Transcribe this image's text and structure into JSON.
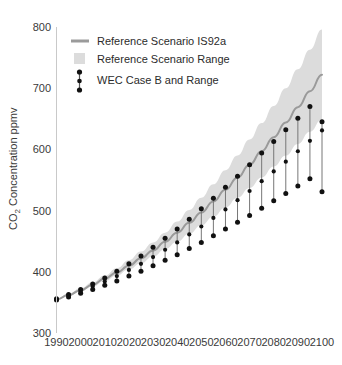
{
  "chart_data": {
    "type": "line",
    "title": "",
    "xlabel": "",
    "ylabel": "CO₂ Concentration ppmv",
    "ylabel_main": "Concentration ppmv",
    "ylabel_sub": "2",
    "ylabel_prefix": "CO",
    "xlim": [
      1990,
      2100
    ],
    "ylim": [
      300,
      800
    ],
    "ytick_values": [
      300,
      400,
      500,
      600,
      700,
      800
    ],
    "ytick_labels": [
      "300",
      "400",
      "500",
      "600",
      "700",
      "800"
    ],
    "xtick_values": [
      1990,
      2000,
      2010,
      2020,
      2030,
      2040,
      2050,
      2060,
      2070,
      2080,
      2090,
      2100
    ],
    "xtick_labels": [
      "1990",
      "2000",
      "2010",
      "2020",
      "2030",
      "2040",
      "2050",
      "2060",
      "2070",
      "2080",
      "2090",
      "2100"
    ],
    "grid": false,
    "legend_position": "top-left",
    "legend": [
      {
        "label": "Reference Scenario IS92a",
        "marker": "line",
        "color": "#9a9a9a"
      },
      {
        "label": "Reference Scenario Range",
        "marker": "band",
        "color": "#dcdcdc"
      },
      {
        "label": "WEC Case B and Range",
        "marker": "errorbar",
        "color": "#1a1a1a"
      }
    ],
    "series": [
      {
        "name": "Reference Scenario IS92a",
        "type": "line",
        "color": "#9a9a9a",
        "x": [
          1990,
          1995,
          2000,
          2005,
          2010,
          2015,
          2020,
          2025,
          2030,
          2035,
          2040,
          2045,
          2050,
          2055,
          2060,
          2065,
          2070,
          2075,
          2080,
          2085,
          2090,
          2095,
          2100
        ],
        "values": [
          355,
          362,
          370,
          379,
          389,
          399,
          410,
          422,
          435,
          449,
          464,
          480,
          497,
          515,
          534,
          554,
          575,
          597,
          620,
          644,
          669,
          695,
          722
        ]
      },
      {
        "name": "Reference Scenario Range upper",
        "type": "band_upper",
        "color": "#dcdcdc",
        "x": [
          1990,
          1995,
          2000,
          2005,
          2010,
          2015,
          2020,
          2025,
          2030,
          2035,
          2040,
          2045,
          2050,
          2055,
          2060,
          2065,
          2070,
          2075,
          2080,
          2085,
          2090,
          2095,
          2100
        ],
        "values": [
          356,
          364,
          373,
          383,
          394,
          406,
          419,
          433,
          448,
          464,
          482,
          501,
          521,
          543,
          566,
          590,
          616,
          643,
          671,
          700,
          731,
          763,
          796
        ]
      },
      {
        "name": "Reference Scenario Range lower",
        "type": "band_lower",
        "color": "#dcdcdc",
        "x": [
          1990,
          1995,
          2000,
          2005,
          2010,
          2015,
          2020,
          2025,
          2030,
          2035,
          2040,
          2045,
          2050,
          2055,
          2060,
          2065,
          2070,
          2075,
          2080,
          2085,
          2090,
          2095,
          2100
        ],
        "values": [
          354,
          361,
          368,
          376,
          385,
          394,
          404,
          414,
          425,
          437,
          449,
          462,
          476,
          490,
          505,
          521,
          537,
          554,
          572,
          590,
          609,
          629,
          649
        ]
      },
      {
        "name": "WEC Case B and Range",
        "type": "errorbar",
        "color": "#1a1a1a",
        "x": [
          1990,
          1995,
          2000,
          2005,
          2010,
          2015,
          2020,
          2025,
          2030,
          2035,
          2040,
          2045,
          2050,
          2055,
          2060,
          2065,
          2070,
          2075,
          2080,
          2085,
          2090,
          2095,
          2100
        ],
        "mid": [
          355,
          361,
          368,
          376,
          384,
          393,
          403,
          413,
          424,
          436,
          448,
          461,
          474,
          488,
          502,
          517,
          532,
          548,
          564,
          580,
          397,
          414,
          586
        ],
        "values": [
          355,
          361,
          368,
          376,
          384,
          393,
          403,
          413,
          424,
          436,
          448,
          461,
          474,
          488,
          502,
          517,
          532,
          548,
          564,
          580,
          597,
          614,
          631
        ],
        "upper": [
          356,
          363,
          371,
          380,
          390,
          401,
          413,
          426,
          440,
          455,
          470,
          486,
          503,
          520,
          538,
          556,
          575,
          594,
          613,
          632,
          651,
          670,
          645
        ],
        "lower": [
          354,
          359,
          365,
          371,
          378,
          385,
          393,
          401,
          410,
          419,
          428,
          438,
          448,
          459,
          470,
          481,
          492,
          504,
          516,
          528,
          540,
          552,
          531
        ]
      }
    ]
  },
  "axes": {
    "y_title_prefix": "CO",
    "y_title_sub": "2",
    "y_title_rest": " Concentration ppmv"
  }
}
